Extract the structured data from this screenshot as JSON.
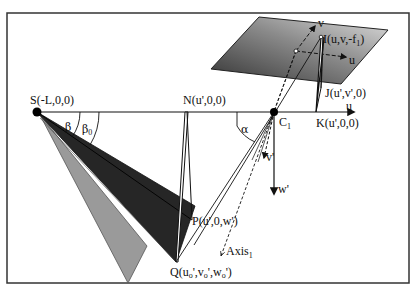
{
  "figure": {
    "width": 415,
    "height": 296,
    "frame": {
      "x": 7,
      "y": 13,
      "w": 402,
      "h": 270,
      "stroke": "#333333"
    },
    "colors": {
      "line": "#111111",
      "dark_fan": "#262626",
      "gray_fan": "#9a9a9a",
      "plane_dark": "#3a3a3a",
      "plane_light": "#d8d8d8"
    }
  },
  "points": {
    "S": {
      "label": "S(-L,0,0)",
      "x": 37,
      "y": 112
    },
    "N": {
      "label": "N(u',0,0)",
      "x": 186,
      "y": 112
    },
    "C1": {
      "label": "C",
      "sub": "1",
      "x": 274,
      "y": 112
    },
    "K": {
      "label": "K(u',0,0)",
      "x": 316,
      "y": 112
    },
    "J": {
      "label": "J(u',v',0)",
      "x": 321,
      "y": 88
    },
    "I": {
      "label_pre": "I(u,v,-f",
      "label_sub": "1",
      "label_post": ")",
      "x": 321,
      "y": 37
    },
    "P": {
      "label": "P(u',0,w')",
      "x": 194,
      "y": 222
    },
    "Q": {
      "label_pre": "Q(u",
      "label_post": ",w",
      "x": 176,
      "y": 262,
      "parts": [
        "Q(u",
        "o",
        "',v",
        "o",
        "',w",
        "o",
        "')"
      ]
    }
  },
  "axes": {
    "u_axis": {
      "label": "u",
      "x1": 37,
      "y1": 112,
      "x2": 356,
      "y2": 112
    },
    "w_prime": {
      "label": "w'",
      "x1": 274,
      "y1": 112,
      "x2": 274,
      "y2": 196
    },
    "v_prime": {
      "label": "v'",
      "x1": 274,
      "y1": 112,
      "x2": 263,
      "y2": 160
    },
    "image_u": {
      "label": "u",
      "x1": 296,
      "y1": 51,
      "x2": 350,
      "y2": 58
    },
    "image_v": {
      "label": "v",
      "x1": 296,
      "y1": 51,
      "x2": 318,
      "y2": 24
    },
    "axis1": {
      "label": "Axis",
      "sub": "1",
      "x1": 274,
      "y1": 112,
      "x2": 221,
      "y2": 257
    }
  },
  "angles": {
    "beta": {
      "label": "β"
    },
    "beta0": {
      "label": "β",
      "sub": "0"
    },
    "alpha": {
      "label": "α"
    }
  },
  "shapes": {
    "image_plane": [
      [
        259,
        17
      ],
      [
        388,
        30
      ],
      [
        341,
        84
      ],
      [
        211,
        69
      ]
    ],
    "gray_triangle": [
      [
        40,
        115
      ],
      [
        147,
        246
      ],
      [
        128,
        283
      ]
    ],
    "dark_fan": [
      [
        37,
        112
      ],
      [
        195,
        206
      ],
      [
        176,
        262
      ]
    ],
    "dark_fan_inner": [
      [
        37,
        112
      ],
      [
        189,
        218
      ],
      [
        176,
        262
      ]
    ]
  }
}
